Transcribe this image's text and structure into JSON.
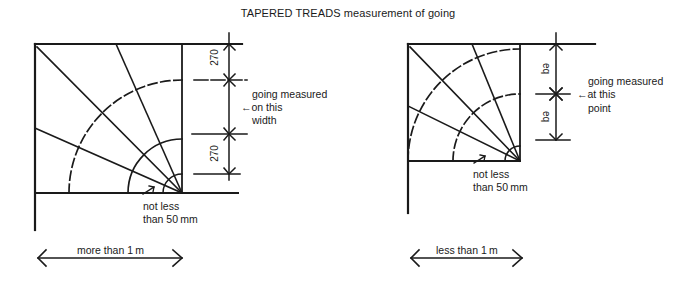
{
  "title": {
    "bold_part": "TAPERED TREADS",
    "rest": " measurement of going"
  },
  "left_diagram": {
    "dimension_upper": "270",
    "dimension_lower": "270",
    "note_line1": "going measured",
    "note_line2": "←on this",
    "note_line3": "width",
    "min_width_line1": "not less",
    "min_width_line2": "than 50 mm",
    "span_label": "more than 1 m"
  },
  "right_diagram": {
    "dimension_upper": "eq",
    "dimension_lower": "eq",
    "note_line1": "going measured",
    "note_line2": "←at this",
    "note_line3": "point",
    "min_width_line1": "not less",
    "min_width_line2": "than 50 mm",
    "span_label": "less than 1 m"
  },
  "colors": {
    "ink": "#1a1a1a",
    "background": "#ffffff"
  }
}
